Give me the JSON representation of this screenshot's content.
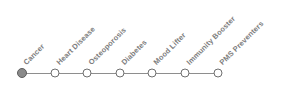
{
  "diagram": {
    "type": "timeline-milestones",
    "orientation": "horizontal",
    "label_angle_deg": -45,
    "background_color": "#ffffff",
    "line_color": "#8e8e8e",
    "label_color": "#7d7d7d",
    "node_active_fill": "#8a8a8a",
    "node_inactive_fill": "#ffffff",
    "node_stroke": "#6f6f6f",
    "nodes": [
      {
        "label": "Cancer",
        "state": "filled",
        "x": 22,
        "y": 73
      },
      {
        "label": "Heart Disease",
        "state": "hollow",
        "x": 55,
        "y": 73
      },
      {
        "label": "Osteoporosis",
        "state": "hollow",
        "x": 87,
        "y": 73
      },
      {
        "label": "Diabetes",
        "state": "hollow",
        "x": 120,
        "y": 73
      },
      {
        "label": "Mood Lifter",
        "state": "hollow",
        "x": 152,
        "y": 73
      },
      {
        "label": "Immunity Booster",
        "state": "hollow",
        "x": 185,
        "y": 73
      },
      {
        "label": "PMS Preventers",
        "state": "hollow",
        "x": 218,
        "y": 73
      }
    ]
  }
}
